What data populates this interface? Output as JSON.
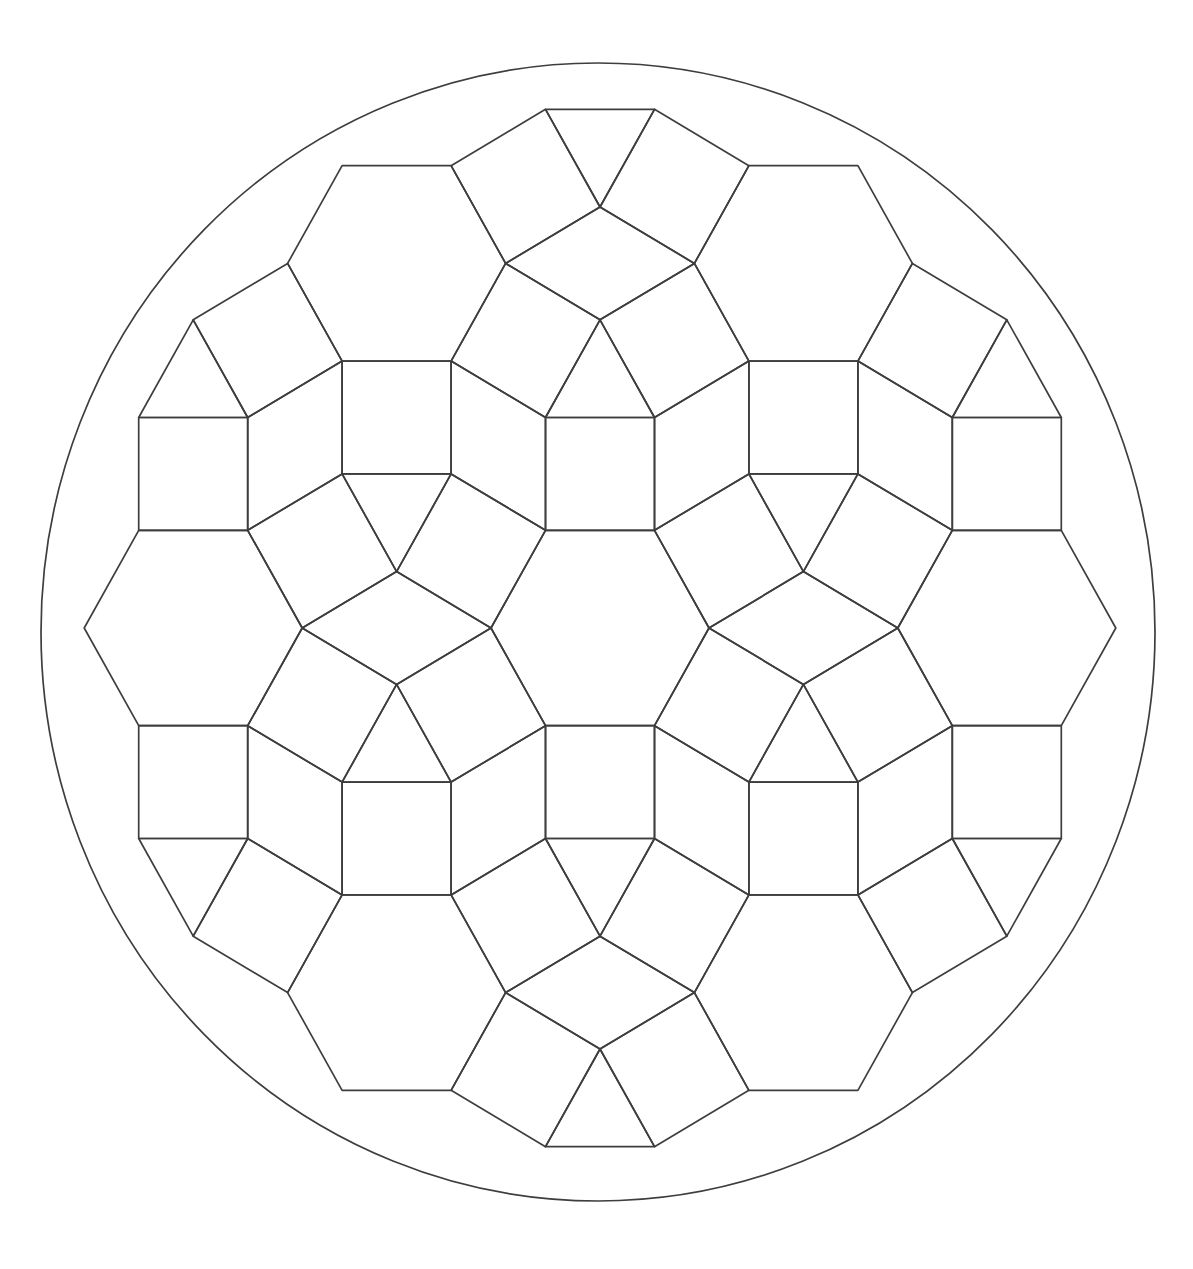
{
  "canvas": {
    "width": 1193,
    "height": 1269,
    "background_color": "#ffffff"
  },
  "drawing": {
    "description": "geometric-tessellation-coloring-pattern",
    "stroke_color": "#3e3e3e",
    "stroke_width": 1.7,
    "fill_color": "none",
    "outer_circle": {
      "cx": 598,
      "cy": 632,
      "rx": 557,
      "ry": 569
    },
    "tiling": {
      "edge_length": 109,
      "y_stretch": 1.035,
      "origin": {
        "x": 600,
        "y": 628
      },
      "hexagons": [
        {
          "id": "L",
          "x": -406.79,
          "y": 0
        },
        {
          "id": "C",
          "x": 0,
          "y": 0
        },
        {
          "id": "R",
          "x": 406.79,
          "y": 0
        },
        {
          "id": "TL",
          "x": -203.4,
          "y": -352.28
        },
        {
          "id": "TR",
          "x": 203.4,
          "y": -352.28
        },
        {
          "id": "BL",
          "x": -203.4,
          "y": 352.28
        },
        {
          "id": "BR",
          "x": 203.4,
          "y": 352.28
        }
      ],
      "squares": {
        "C": [
          "N",
          "NE",
          "SE",
          "S",
          "SW",
          "NW"
        ],
        "L": [
          "N",
          "NE",
          "SE",
          "S"
        ],
        "R": [
          "N",
          "NW",
          "SW",
          "S"
        ],
        "TL": [
          "NE",
          "SE",
          "S",
          "SW"
        ],
        "TR": [
          "NW",
          "SW",
          "S",
          "SE"
        ],
        "BL": [
          "N",
          "NE",
          "NW",
          "SE"
        ],
        "BR": [
          "N",
          "NW",
          "NE",
          "SW"
        ]
      },
      "rhombi": [
        [
          "L",
          "C"
        ],
        [
          "C",
          "R"
        ],
        [
          "TL",
          "TR"
        ],
        [
          "BL",
          "BR"
        ],
        [
          "L",
          "TL"
        ],
        [
          "TL",
          "C"
        ],
        [
          "C",
          "TR"
        ],
        [
          "TR",
          "R"
        ],
        [
          "L",
          "BL"
        ],
        [
          "BL",
          "C"
        ],
        [
          "C",
          "BR"
        ],
        [
          "BR",
          "R"
        ]
      ],
      "triangles": [
        {
          "id": "T1",
          "x": 0,
          "y": -234.85,
          "dir": "up"
        },
        {
          "id": "T2",
          "x": -203.4,
          "y": -117.43,
          "dir": "down"
        },
        {
          "id": "T3",
          "x": 203.4,
          "y": -117.43,
          "dir": "down"
        },
        {
          "id": "T4",
          "x": -203.4,
          "y": 117.43,
          "dir": "up"
        },
        {
          "id": "T5",
          "x": 0,
          "y": 234.85,
          "dir": "down"
        },
        {
          "id": "T6",
          "x": 203.4,
          "y": 117.43,
          "dir": "up"
        },
        {
          "id": "T7",
          "x": 0,
          "y": -469.71,
          "dir": "down"
        },
        {
          "id": "T8",
          "x": 0,
          "y": 469.71,
          "dir": "up"
        },
        {
          "id": "T9",
          "x": -406.79,
          "y": -234.85,
          "dir": "up"
        },
        {
          "id": "T10",
          "x": 406.79,
          "y": -234.85,
          "dir": "up"
        },
        {
          "id": "T11",
          "x": -406.79,
          "y": 234.85,
          "dir": "down"
        },
        {
          "id": "T12",
          "x": 406.79,
          "y": 234.85,
          "dir": "down"
        }
      ]
    }
  }
}
